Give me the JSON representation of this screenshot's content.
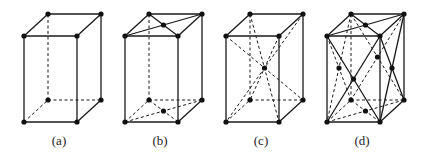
{
  "figure": {
    "panels": [
      {
        "id": "a",
        "label": "(a)",
        "lattice": "primitive",
        "extra_points": [],
        "diagonals": []
      },
      {
        "id": "b",
        "label": "(b)",
        "lattice": "base-centered",
        "extra_points": [
          "top-face-center",
          "bottom-face-center"
        ],
        "diagonals": [
          "top-face",
          "bottom-face"
        ]
      },
      {
        "id": "c",
        "label": "(c)",
        "lattice": "body-centered",
        "extra_points": [
          "body-center"
        ],
        "diagonals": [
          "body"
        ]
      },
      {
        "id": "d",
        "label": "(d)",
        "lattice": "face-centered",
        "extra_points": [
          "top-face-center",
          "bottom-face-center",
          "front-face-center",
          "back-face-center",
          "left-face-center",
          "right-face-center"
        ],
        "diagonals": [
          "all-faces"
        ]
      }
    ],
    "colors": {
      "line": "#1a1a1a",
      "point": "#111111",
      "background": "#ffffff"
    }
  }
}
